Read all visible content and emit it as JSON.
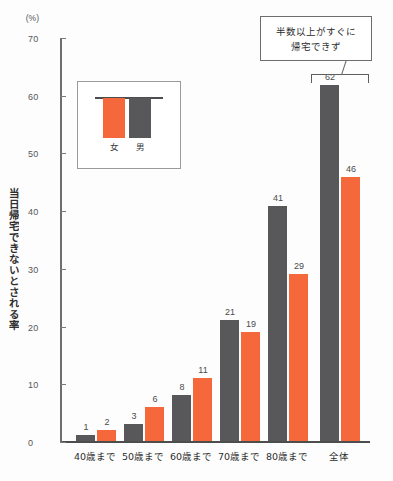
{
  "chart_data": {
    "type": "bar",
    "title": "",
    "xlabel": "",
    "ylabel": "当日帰宅できないとされる率",
    "ylim": [
      0,
      70
    ],
    "yunit": "(%)",
    "grid": false,
    "legend_position": "inside-right",
    "categories": [
      "40歳まで",
      "50歳まで",
      "60歳まで",
      "70歳まで",
      "80歳まで",
      "全体"
    ],
    "series": [
      {
        "name": "女",
        "color": "#f4683c",
        "values": [
          2,
          6,
          11,
          19,
          29,
          46
        ]
      },
      {
        "name": "男",
        "color": "#58585a",
        "values": [
          1,
          3,
          8,
          21,
          41,
          62
        ]
      }
    ],
    "yticks": [
      "0",
      "10",
      "20",
      "30",
      "40",
      "50",
      "60",
      "70"
    ],
    "ytick_values": [
      0,
      10,
      20,
      30,
      40,
      50,
      60,
      70
    ],
    "annotation": {
      "line1": "半数以上がすぐに",
      "line2": "帰宅できず",
      "points_to": "全体"
    }
  },
  "legend": {
    "female_label": "女",
    "male_label": "男"
  },
  "axis": {
    "title": "当日帰宅できないとされる率",
    "unit": "(%)"
  }
}
